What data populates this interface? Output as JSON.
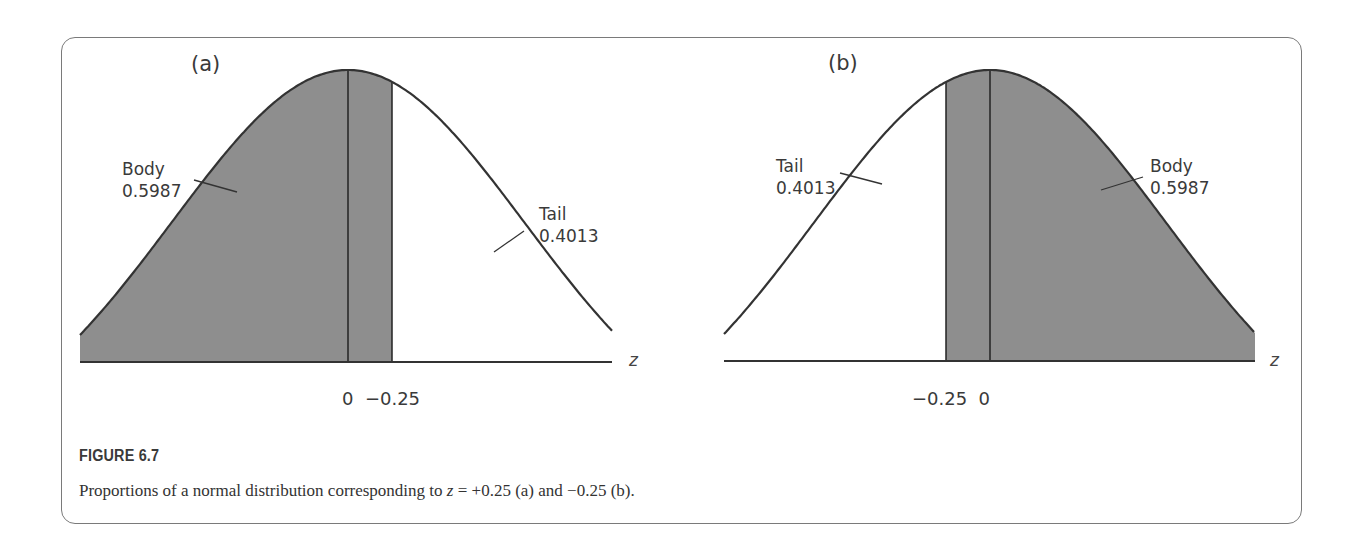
{
  "figure": {
    "title": "FIGURE 6.7",
    "caption_prefix": "Proportions of a normal distribution corresponding to ",
    "caption_var": "z",
    "caption_suffix": " = +0.25 (a) and −0.25 (b)."
  },
  "colors": {
    "shade": "#8e8e8e",
    "curve": "#333333",
    "frame": "#7a7a7a",
    "text": "#3a3a3a"
  },
  "panels": [
    {
      "label": "(a)",
      "body_label": "Body",
      "body_value": "0.5987",
      "tail_label": "Tail",
      "tail_value": "0.4013",
      "axis_var": "z",
      "tick_labels": "0  −0.25"
    },
    {
      "label": "(b)",
      "body_label": "Body",
      "body_value": "0.5987",
      "tail_label": "Tail",
      "tail_value": "0.4013",
      "axis_var": "z",
      "tick_labels": "−0.25  0"
    }
  ],
  "chart_data": [
    {
      "type": "area",
      "title": "(a)",
      "distribution": "standard normal",
      "xlabel": "z",
      "ylabel": "",
      "z_value": 0.25,
      "tick_labels": [
        "0",
        "−0.25"
      ],
      "shaded_region": "z < +0.25 (body, left side)",
      "regions": [
        {
          "name": "Body",
          "proportion": 0.5987,
          "side": "left"
        },
        {
          "name": "Tail",
          "proportion": 0.4013,
          "side": "right"
        }
      ],
      "grid": false
    },
    {
      "type": "area",
      "title": "(b)",
      "distribution": "standard normal",
      "xlabel": "z",
      "ylabel": "",
      "z_value": -0.25,
      "tick_labels": [
        "−0.25",
        "0"
      ],
      "shaded_region": "z > −0.25 (body, right side)",
      "regions": [
        {
          "name": "Tail",
          "proportion": 0.4013,
          "side": "left"
        },
        {
          "name": "Body",
          "proportion": 0.5987,
          "side": "right"
        }
      ],
      "grid": false
    }
  ]
}
